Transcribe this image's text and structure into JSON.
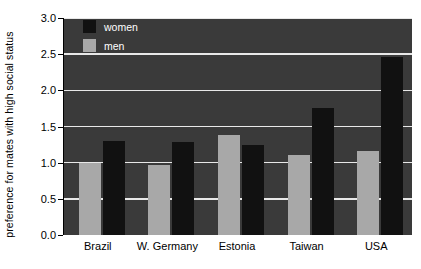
{
  "chart_data": {
    "type": "bar",
    "title": "",
    "xlabel": "",
    "ylabel": "preference for  mates with high social status",
    "categories": [
      "Brazil",
      "W. Germany",
      "Estonia",
      "Taiwan",
      "USA"
    ],
    "series": [
      {
        "name": "women",
        "color": "#111111",
        "values": [
          1.3,
          1.28,
          1.25,
          1.76,
          2.46
        ]
      },
      {
        "name": "men",
        "color": "#a8a8a8",
        "values": [
          1.0,
          0.97,
          1.38,
          1.1,
          1.16
        ]
      }
    ],
    "series_order_in_group": [
      "men",
      "women"
    ],
    "ylim": [
      0.0,
      3.0
    ],
    "yticks": [
      "0.0",
      "0.5",
      "1.0",
      "1.5",
      "2.0",
      "2.5",
      "3.0"
    ],
    "ytick_values": [
      0.0,
      0.5,
      1.0,
      1.5,
      2.0,
      2.5,
      3.0
    ],
    "grid": true,
    "grid_axis": "y",
    "grid_color": "#e8e8e8",
    "legend_position": "top-left-inside",
    "plot_background": "#3a3a3a",
    "figure_background": "#ffffff"
  },
  "legend": {
    "entries": [
      {
        "label": "women",
        "color": "#111111"
      },
      {
        "label": "men",
        "color": "#a8a8a8"
      }
    ]
  }
}
